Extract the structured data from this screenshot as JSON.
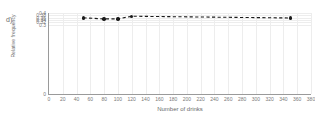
{
  "panel": {
    "label": "d)"
  },
  "chart_data": {
    "type": "line",
    "title": "",
    "subtitle": "",
    "xlabel": "Number of drinks",
    "ylabel": "Relative frequency",
    "x": [
      50,
      80,
      100,
      120,
      350
    ],
    "values": [
      0.358,
      0.349,
      0.349,
      0.372,
      0.357
    ],
    "series": [
      {
        "name": "Relative frequency",
        "x": [
          50,
          80,
          100,
          120,
          350
        ],
        "values": [
          0.358,
          0.349,
          0.349,
          0.372,
          0.357
        ],
        "marker": "filled-circle",
        "line_style": "dashed",
        "color": "#1a1a1a"
      }
    ],
    "xlim": [
      0,
      380
    ],
    "ylim": [
      0.3,
      0.4
    ],
    "y_axis_has_zero_break": true,
    "xticks": [
      0,
      20,
      40,
      60,
      80,
      100,
      120,
      140,
      160,
      180,
      200,
      220,
      240,
      260,
      280,
      300,
      320,
      340,
      360,
      380
    ],
    "xtick_labels": [
      "0",
      "20",
      "40",
      "60",
      "80",
      "100",
      "120",
      "140",
      "160",
      "180",
      "200",
      "220",
      "240",
      "260",
      "280",
      "300",
      "320",
      "340",
      "360",
      "380"
    ],
    "yticks": [
      0,
      0.3,
      0.32,
      0.34,
      0.36,
      0.38,
      0.4
    ],
    "ytick_labels": [
      "0",
      "0.3",
      "0.32",
      "0.34",
      "0.36",
      "0.38",
      "0.4"
    ],
    "grid": true,
    "grid_color": "#ededed",
    "legend": false,
    "legend_position": "none",
    "axis_color": "#9a9a9a",
    "text_color": "#7a7a7a"
  }
}
